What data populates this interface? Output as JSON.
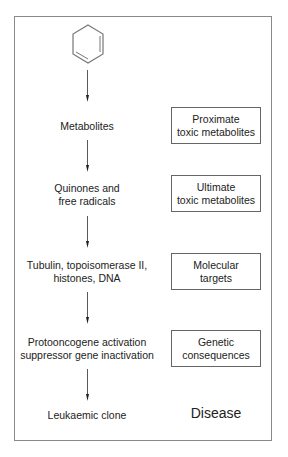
{
  "diagram": {
    "start": {
      "label": "Benzene",
      "icon": "benzene-ring-icon"
    },
    "steps": [
      {
        "left": [
          "Metabolites"
        ],
        "right": [
          "Proximate",
          "toxic metabolites"
        ]
      },
      {
        "left": [
          "Quinones and",
          "free radicals"
        ],
        "right": [
          "Ultimate",
          "toxic metabolites"
        ]
      },
      {
        "left": [
          "Tubulin, topoisomerase II,",
          "histones, DNA"
        ],
        "right": [
          "Molecular",
          "targets"
        ]
      },
      {
        "left": [
          "Protooncogene activation",
          "suppressor gene inactivation"
        ],
        "right": [
          "Genetic",
          "consequences"
        ]
      },
      {
        "left": [
          "Leukaemic clone"
        ],
        "right_plain": "Disease"
      }
    ],
    "colors": {
      "frame": "#8a8a8a",
      "box": "#666666",
      "text": "#222222"
    }
  }
}
